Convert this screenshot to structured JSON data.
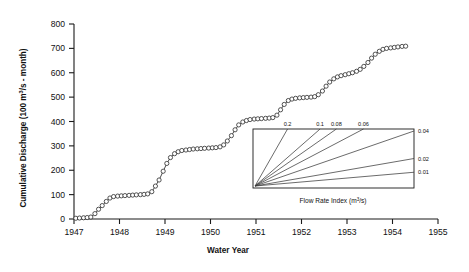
{
  "figure": {
    "background": "#ffffff",
    "line_color": "#2b2b2b",
    "marker_fill": "#ffffff",
    "axis_color": "#1a1a1a"
  },
  "chart_data": {
    "type": "line",
    "title": "",
    "xlabel": "Water Year",
    "ylabel": "Cumulative Discharge (100 m³/s - month)",
    "xlim": [
      1947,
      1955
    ],
    "ylim": [
      0,
      800
    ],
    "xticks": [
      1947,
      1948,
      1949,
      1950,
      1951,
      1952,
      1953,
      1954,
      1955
    ],
    "xticklabels": [
      "1947",
      "1948",
      "1949",
      "1950",
      "1951",
      "1952",
      "1953",
      "1954",
      "1955"
    ],
    "yticks": [
      0,
      100,
      200,
      300,
      400,
      500,
      600,
      700,
      800
    ],
    "yticklabels": [
      "0",
      "100",
      "200",
      "300",
      "400",
      "500",
      "600",
      "700",
      "800"
    ],
    "grid": false,
    "legend": "none",
    "marker": "open-circle",
    "series": [
      {
        "name": "Cumulative Discharge",
        "x": [
          1947.04,
          1947.12,
          1947.21,
          1947.29,
          1947.37,
          1947.46,
          1947.54,
          1947.62,
          1947.71,
          1947.79,
          1947.87,
          1947.96,
          1948.04,
          1948.12,
          1948.21,
          1948.29,
          1948.37,
          1948.46,
          1948.54,
          1948.62,
          1948.71,
          1948.79,
          1948.87,
          1948.96,
          1949.04,
          1949.12,
          1949.21,
          1949.29,
          1949.37,
          1949.46,
          1949.54,
          1949.62,
          1949.71,
          1949.79,
          1949.87,
          1949.96,
          1950.04,
          1950.12,
          1950.21,
          1950.29,
          1950.37,
          1950.46,
          1950.54,
          1950.62,
          1950.71,
          1950.79,
          1950.87,
          1950.96,
          1951.04,
          1951.12,
          1951.21,
          1951.29,
          1951.37,
          1951.46,
          1951.54,
          1951.62,
          1951.71,
          1951.79,
          1951.87,
          1951.96,
          1952.04,
          1952.12,
          1952.21,
          1952.29,
          1952.37,
          1952.46,
          1952.54,
          1952.62,
          1952.71,
          1952.79,
          1952.87,
          1952.96,
          1953.04,
          1953.12,
          1953.21,
          1953.29,
          1953.37,
          1953.46,
          1953.54,
          1953.62,
          1953.71,
          1953.79,
          1953.87,
          1953.96,
          1954.04,
          1954.12,
          1954.21,
          1954.29
        ],
        "y": [
          3,
          4,
          5,
          6,
          8,
          22,
          40,
          55,
          72,
          86,
          92,
          94,
          95,
          96,
          97,
          98,
          99,
          100,
          101,
          103,
          112,
          135,
          160,
          196,
          228,
          252,
          268,
          276,
          281,
          283,
          285,
          287,
          288,
          289,
          290,
          291,
          292,
          293,
          296,
          304,
          320,
          342,
          366,
          386,
          398,
          404,
          408,
          410,
          411,
          412,
          413,
          414,
          416,
          426,
          448,
          470,
          486,
          492,
          495,
          497,
          498,
          499,
          500,
          502,
          510,
          525,
          545,
          562,
          575,
          583,
          588,
          592,
          596,
          600,
          606,
          614,
          626,
          642,
          660,
          676,
          688,
          696,
          700,
          702,
          704,
          706,
          708,
          709
        ]
      }
    ],
    "inset": {
      "caption": "Flow Rate Index  (m³/s)",
      "caption_units": "m³/s",
      "top_labels": [
        "0.2",
        "0.1",
        "0.08",
        "0.06"
      ],
      "right_labels": [
        "0.04",
        "0.02",
        "0.01"
      ],
      "values": [
        0.2,
        0.1,
        0.08,
        0.06,
        0.04,
        0.02,
        0.01
      ],
      "description": "fan of slope reference lines radiating from lower-left corner"
    }
  }
}
